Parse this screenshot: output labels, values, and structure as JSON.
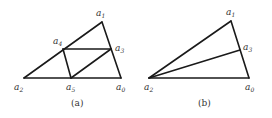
{
  "figures": [
    {
      "id": "a",
      "caption": "(a)",
      "vertices": [
        {
          "name": "a0",
          "letter": "a",
          "index": "0"
        },
        {
          "name": "a1",
          "letter": "a",
          "index": "1"
        },
        {
          "name": "a2",
          "letter": "a",
          "index": "2"
        },
        {
          "name": "a3",
          "letter": "a",
          "index": "3"
        },
        {
          "name": "a4",
          "letter": "a",
          "index": "4"
        },
        {
          "name": "a5",
          "letter": "a",
          "index": "5"
        }
      ],
      "edges": [
        [
          "a2",
          "a1"
        ],
        [
          "a1",
          "a0"
        ],
        [
          "a2",
          "a0"
        ],
        [
          "a4",
          "a3"
        ],
        [
          "a4",
          "a5"
        ],
        [
          "a5",
          "a3"
        ]
      ]
    },
    {
      "id": "b",
      "caption": "(b)",
      "vertices": [
        {
          "name": "a0",
          "letter": "a",
          "index": "0"
        },
        {
          "name": "a1",
          "letter": "a",
          "index": "1"
        },
        {
          "name": "a2",
          "letter": "a",
          "index": "2"
        },
        {
          "name": "a3",
          "letter": "a",
          "index": "3"
        }
      ],
      "edges": [
        [
          "a2",
          "a1"
        ],
        [
          "a1",
          "a0"
        ],
        [
          "a2",
          "a0"
        ],
        [
          "a2",
          "a3"
        ]
      ]
    }
  ]
}
